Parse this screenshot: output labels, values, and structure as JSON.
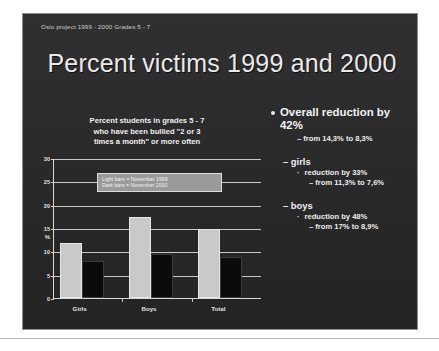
{
  "slide": {
    "header": "Oslo project 1999 - 2000   Grades 5 - 7",
    "title": "Percent victims 1999 and 2000",
    "background_color": "#2b2b2b",
    "text_color": "#eeeeee"
  },
  "chart_caption": {
    "line1": "Percent students in grades 5 - 7",
    "line2": "who have been bullied \"2 or 3",
    "line3": "times a month\" or more often"
  },
  "legend": {
    "line1": "Light bars = November  1999",
    "line2": "Dark  bars  = November  2000"
  },
  "bullets": {
    "overall": {
      "text": "Overall reduction by 42%",
      "detail": "– from 14,3% to 8,3%"
    },
    "girls": {
      "label": "– girls",
      "reduction": "reduction by 33%",
      "detail": "– from 11,3% to 7,6%"
    },
    "boys": {
      "label": "– boys",
      "reduction": "reduction by 48%",
      "detail": "– from 17% to 8,9%"
    },
    "dash": "–",
    "square_bullet": "·"
  },
  "chart_data": {
    "type": "bar",
    "title": "Percent students in grades 5 - 7 who have been bullied \"2 or 3 times a month\" or more often",
    "xlabel": "",
    "ylabel": "%",
    "ylim": [
      0,
      30
    ],
    "yticks": [
      0,
      5,
      10,
      15,
      20,
      25,
      30
    ],
    "ytick_labels": [
      "0",
      "5",
      "10",
      "15",
      "20",
      "25",
      "30"
    ],
    "grid": true,
    "legend_position": "inside-top-center",
    "categories": [
      "Girls",
      "Boys",
      "Total"
    ],
    "series": [
      {
        "name": "Light bars = November  1999",
        "color": "#c9c9c9",
        "values": [
          11.3,
          17.0,
          14.3
        ]
      },
      {
        "name": "Dark  bars  = November  2000",
        "color": "#0b0b0b",
        "values": [
          7.6,
          8.9,
          8.3
        ]
      }
    ]
  }
}
